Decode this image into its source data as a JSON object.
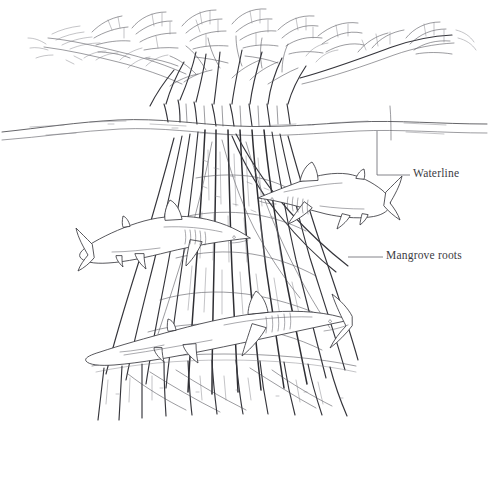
{
  "illustration": {
    "title": "Mangrove habitat with sharks",
    "medium": "pen-and-ink line drawing",
    "background_color": "#ffffff",
    "ink_color": "#3b3b3f",
    "width": 489,
    "height": 483
  },
  "labels": [
    {
      "id": "waterline",
      "text": "Waterline",
      "leader": "L-shaped leader from water surface down and right to text",
      "x": 413,
      "y": 168
    },
    {
      "id": "mangrove-roots",
      "text": "Mangrove roots",
      "leader": "horizontal leader from root mass right to text",
      "x": 386,
      "y": 250
    }
  ],
  "scene_elements": [
    {
      "name": "mangrove-canopy",
      "description": "dense foliage and branches above waterline"
    },
    {
      "name": "canopy-branch-right",
      "description": "long branch extending to the right edge with leaf clusters"
    },
    {
      "name": "water-surface-line",
      "description": "wavy double horizontal line spanning full width"
    },
    {
      "name": "prop-root-mass",
      "description": "bundle of vertical arching mangrove prop roots"
    },
    {
      "name": "seafloor",
      "description": "root tips fading into sediment at bottom"
    },
    {
      "name": "shark-left",
      "description": "shark swimming left, mid-left of frame"
    },
    {
      "name": "shark-right",
      "description": "shark swimming right, upper-right of frame"
    },
    {
      "name": "shark-bottom",
      "description": "large shark swimming left across lower frame"
    }
  ]
}
